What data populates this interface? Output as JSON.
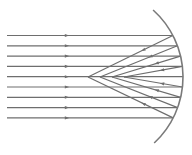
{
  "diagram": {
    "colors": {
      "background": "#ffffff",
      "ray": "#6e6e6e",
      "mirror": "#7a7a7a"
    },
    "mirror": {
      "type": "concave-arc",
      "center_x": 93,
      "center_y": 77,
      "radius": 90
    },
    "incident_rays": {
      "count": 9,
      "start_x": 7,
      "first_y": 35.5,
      "spacing": 10.3,
      "arrow_x": 67
    },
    "reflected_targets_x": [
      88,
      100,
      112,
      124,
      132,
      124,
      112,
      100,
      88
    ]
  }
}
